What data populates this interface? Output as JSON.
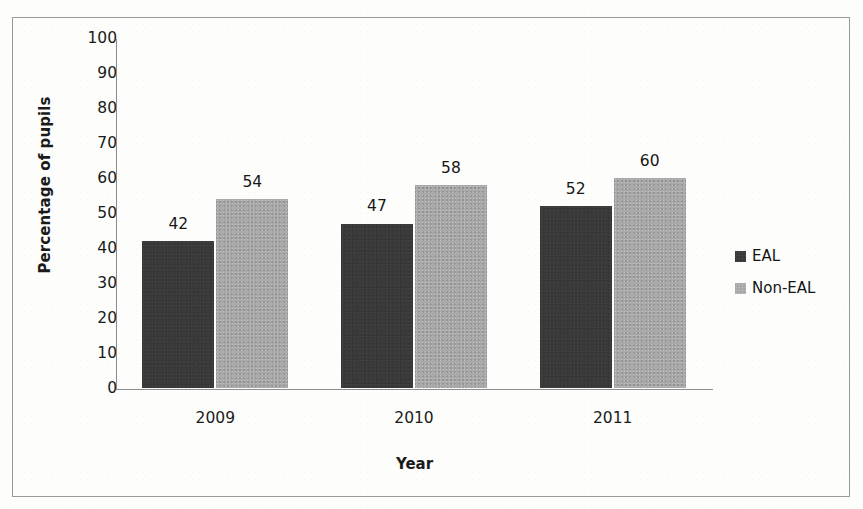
{
  "chart_data": {
    "type": "bar",
    "title": "",
    "subtitle": "",
    "xlabel": "Year",
    "ylabel": "Percentage of pupils",
    "categories": [
      "2009",
      "2010",
      "2011"
    ],
    "series": [
      {
        "name": "EAL",
        "values": [
          42,
          47,
          52
        ],
        "color": "#3a3a3a"
      },
      {
        "name": "Non-EAL",
        "values": [
          54,
          58,
          60
        ],
        "color": "#a9a9a9"
      }
    ],
    "ylim": [
      0,
      100
    ],
    "ytick_step": 10,
    "ytick_labels": [
      "100",
      "90",
      "80",
      "70",
      "60",
      "50",
      "40",
      "30",
      "20",
      "10",
      "0"
    ],
    "grid": false,
    "legend_position": "right",
    "data_labels": true,
    "annotations": []
  },
  "axes": {
    "y_title": "Percentage of pupils",
    "x_title": "Year"
  },
  "legend": {
    "items": [
      {
        "label": "EAL",
        "swatch": "eal"
      },
      {
        "label": "Non-EAL",
        "swatch": "noneal"
      }
    ]
  },
  "colors": {
    "eal": "#3a3a3a",
    "non_eal": "#a9a9a9",
    "axis": "#8d8d8d",
    "frame": "#9a9a9a",
    "text": "#1a1a1a",
    "background": "#fdfdfc"
  }
}
